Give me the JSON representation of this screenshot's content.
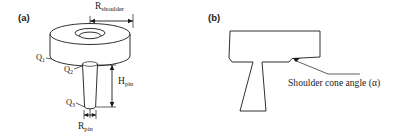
{
  "figure": {
    "background_color": "#ffffff",
    "line_color": "#1a1a1a",
    "panels": [
      {
        "id": "a",
        "label": "(a)",
        "description": "Three-dimensional view of a friction stir welding tool showing the shoulder cylinder with a central hole and a tapered pin below it.",
        "dimensions": [
          {
            "name": "shoulder-radius",
            "symbol": "R",
            "subscript": "shoulder"
          },
          {
            "name": "pin-height",
            "symbol": "H",
            "subscript": "pin"
          },
          {
            "name": "pin-radius",
            "symbol": "R",
            "subscript": "pin"
          }
        ],
        "points": [
          {
            "name": "q1",
            "symbol": "Q",
            "subscript": "1"
          },
          {
            "name": "q2",
            "symbol": "Q",
            "subscript": "2"
          },
          {
            "name": "q3",
            "symbol": "Q",
            "subscript": "3"
          }
        ]
      },
      {
        "id": "b",
        "label": "(b)",
        "description": "Cross-sectional T-shaped profile of the tool showing the sloped shoulder underside.",
        "annotation": "Shoulder cone angle (α)"
      }
    ]
  }
}
